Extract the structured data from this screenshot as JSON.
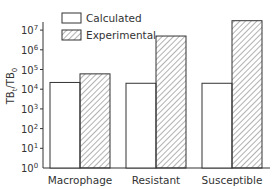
{
  "chart_data": {
    "type": "bar",
    "title": "",
    "xlabel": "",
    "ylabel": "TB_t/TB_0",
    "yscale": "log",
    "ylim": [
      1,
      100000000
    ],
    "yticks": [
      {
        "exp": 0,
        "label": "10",
        "sup": "0"
      },
      {
        "exp": 1,
        "label": "10",
        "sup": "1"
      },
      {
        "exp": 2,
        "label": "10",
        "sup": "2"
      },
      {
        "exp": 3,
        "label": "10",
        "sup": "3"
      },
      {
        "exp": 4,
        "label": "10",
        "sup": "4"
      },
      {
        "exp": 5,
        "label": "10",
        "sup": "5"
      },
      {
        "exp": 6,
        "label": "10",
        "sup": "6"
      },
      {
        "exp": 7,
        "label": "10",
        "sup": "7"
      }
    ],
    "categories": [
      "Macrophage",
      "Resistant",
      "Susceptible"
    ],
    "series": [
      {
        "name": "Calculated",
        "pattern": "none",
        "values": [
          22000,
          20000,
          20000
        ]
      },
      {
        "name": "Experimental",
        "pattern": "hatched",
        "values": [
          60000,
          5000000,
          30000000
        ]
      }
    ],
    "grid": false,
    "legend_position": "top-left"
  },
  "legend": {
    "items": [
      {
        "label": "Calculated",
        "pattern": "none"
      },
      {
        "label": "Experimental",
        "pattern": "hatched"
      }
    ]
  },
  "colors": {
    "line": "#333333",
    "fill": "#ffffff",
    "hatch": "#555555"
  }
}
